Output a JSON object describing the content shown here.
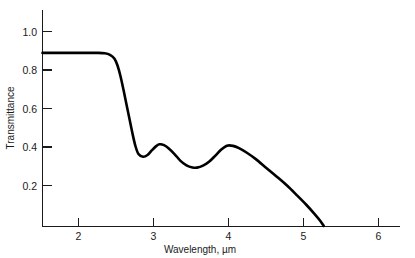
{
  "chart_data": {
    "type": "line",
    "title": "",
    "subtitle": "",
    "xlabel": "Wavelength, µm",
    "ylabel": "Transmittance",
    "xlim": [
      1.52,
      4.77
    ],
    "ylim": [
      0.0,
      1.08
    ],
    "xticks": [
      2,
      3,
      4,
      5,
      6
    ],
    "xtick_labels": [
      "2",
      "3",
      "4",
      "5",
      "6"
    ],
    "yticks": [
      0.2,
      0.4,
      0.6,
      0.8,
      1.0
    ],
    "ytick_labels": [
      "0.2",
      "0.4",
      "0.6",
      "0.8",
      "1.0"
    ],
    "grid": false,
    "legend": false,
    "legend_position": "none",
    "line_color": "#000000",
    "series": [
      {
        "name": "Transmittance",
        "x": [
          1.52,
          1.7,
          1.9,
          2.1,
          2.25,
          2.35,
          2.42,
          2.48,
          2.52,
          2.56,
          2.6,
          2.64,
          2.68,
          2.72,
          2.76,
          2.8,
          2.86,
          2.92,
          2.98,
          3.04,
          3.08,
          3.14,
          3.2,
          3.28,
          3.36,
          3.44,
          3.52,
          3.58,
          3.66,
          3.74,
          3.82,
          3.9,
          3.98,
          4.06,
          4.14,
          4.24,
          4.36,
          4.5,
          4.64,
          4.78,
          4.92,
          5.04,
          5.14,
          5.22,
          5.27
        ],
        "y": [
          0.89,
          0.89,
          0.89,
          0.89,
          0.89,
          0.888,
          0.88,
          0.86,
          0.825,
          0.77,
          0.7,
          0.625,
          0.55,
          0.475,
          0.41,
          0.37,
          0.356,
          0.365,
          0.39,
          0.412,
          0.42,
          0.416,
          0.4,
          0.37,
          0.335,
          0.312,
          0.301,
          0.3,
          0.31,
          0.33,
          0.36,
          0.392,
          0.413,
          0.412,
          0.4,
          0.378,
          0.345,
          0.3,
          0.255,
          0.208,
          0.155,
          0.108,
          0.065,
          0.028,
          0.0
        ]
      }
    ],
    "annotations": [
      {
        "label": "plateau transmittance",
        "value": 0.89,
        "x_range": [
          1.52,
          2.42
        ]
      },
      {
        "label": "absorption edge drop",
        "value": 0.356,
        "x": 2.8
      },
      {
        "label": "first interference peak",
        "value": 0.42,
        "x": 3.08
      },
      {
        "label": "interference trough",
        "value": 0.3,
        "x": 3.55
      },
      {
        "label": "second interference peak",
        "value": 0.413,
        "x": 3.98
      },
      {
        "label": "cutoff wavelength",
        "value": 0.0,
        "x": 5.27
      }
    ]
  }
}
